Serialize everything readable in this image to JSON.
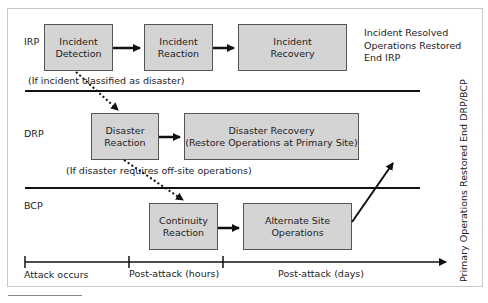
{
  "rows": {
    "irp": {
      "label": "IRP"
    },
    "drp": {
      "label": "DRP"
    },
    "bcp": {
      "label": "BCP"
    }
  },
  "boxes": {
    "incident_detection": "Incident Detection",
    "incident_reaction": "Incident Reaction",
    "incident_recovery": "Incident Recovery",
    "disaster_reaction": "Disaster Reaction",
    "disaster_recovery_1": "Disaster Recovery",
    "disaster_recovery_2": "(Restore Operations at Primary Site)",
    "continuity_reaction": "Continuity Reaction",
    "alternate_site": "Alternate Site Operations"
  },
  "notes": {
    "irp_end_1": "Incident Resolved",
    "irp_end_2": "Operations Restored",
    "irp_end_3": "End IRP",
    "if_disaster": "(If incident classified as disaster)",
    "if_offsite": "(If disaster requires off-site operations)",
    "drp_bcp_end": "Primary Operations Restored End DRP/BCP"
  },
  "timeline": {
    "t0": "Attack occurs",
    "t1": "Post-attack (hours)",
    "t2": "Post-attack (days)"
  },
  "colors": {
    "box_fill": "#d4d4d4",
    "box_border": "#555555",
    "line": "#111111"
  }
}
